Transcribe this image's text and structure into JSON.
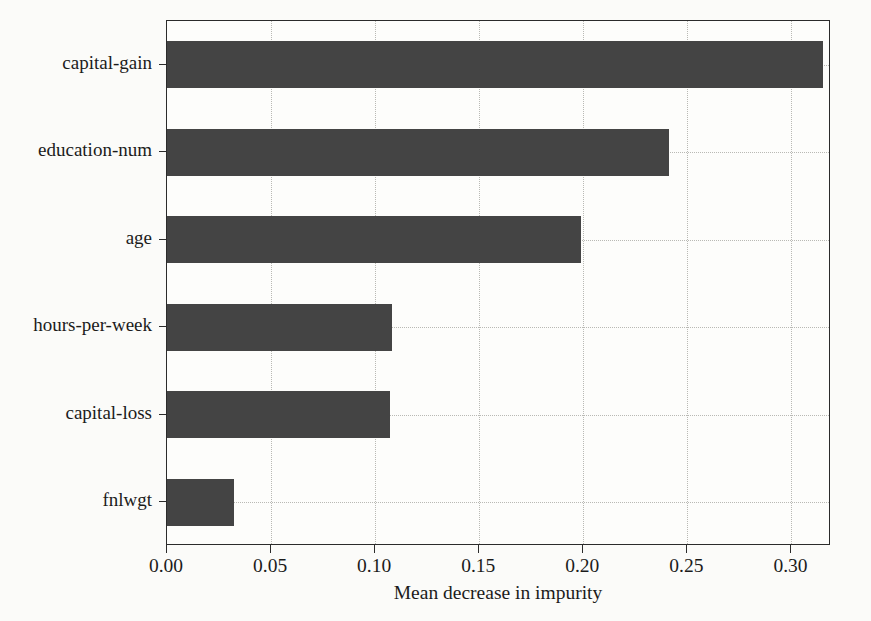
{
  "chart_data": {
    "type": "bar",
    "orientation": "horizontal",
    "title": "",
    "xlabel": "Mean decrease in impurity",
    "ylabel": "",
    "categories": [
      "capital-gain",
      "education-num",
      "age",
      "hours-per-week",
      "capital-loss",
      "fnlwgt"
    ],
    "values": [
      0.315,
      0.241,
      0.199,
      0.108,
      0.107,
      0.032
    ],
    "xlim": [
      0.0,
      0.319
    ],
    "xticks": [
      0.0,
      0.05,
      0.1,
      0.15,
      0.2,
      0.25,
      0.3
    ],
    "xtick_labels": [
      "0.00",
      "0.05",
      "0.10",
      "0.15",
      "0.20",
      "0.25",
      "0.30"
    ],
    "grid": true,
    "grid_style": "dotted",
    "legend": null,
    "bar_color": "#444444",
    "background_color": "#fbfbf9",
    "axis_color": "#2b2b2b",
    "gridline_color": "#b9b9b4"
  }
}
